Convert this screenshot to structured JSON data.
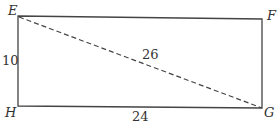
{
  "diagram": {
    "type": "rectangle",
    "vertices": {
      "top_left": "E",
      "top_right": "F",
      "bottom_right": "G",
      "bottom_left": "H"
    },
    "labels": {
      "E": "E",
      "F": "F",
      "G": "G",
      "H": "H",
      "side_EH": "10",
      "side_HG": "24",
      "diagonal_EG": "26"
    },
    "colors": {
      "stroke": "#444444",
      "text": "#333333",
      "background": "#ffffff"
    },
    "diagonal_style": "dashed"
  }
}
